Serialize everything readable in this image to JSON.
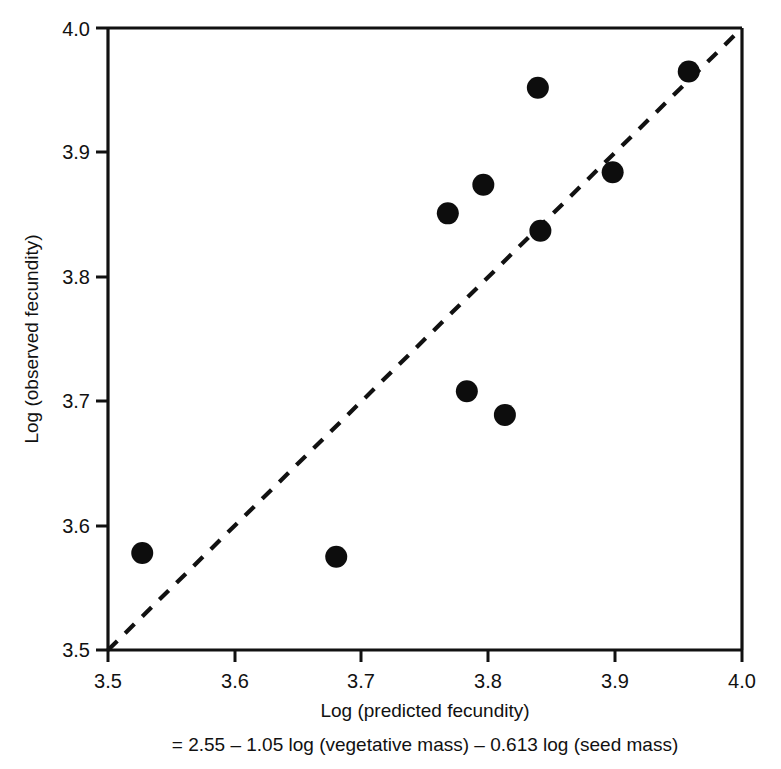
{
  "chart_data": {
    "type": "scatter",
    "title": "",
    "xlabel": "Log (predicted fecundity)",
    "xlabel_line2": "= 2.55 – 1.05 log (vegetative mass) – 0.613 log (seed mass)",
    "ylabel": "Log (observed fecundity)",
    "xlim": [
      3.5,
      4.0
    ],
    "ylim": [
      3.5,
      4.0
    ],
    "grid": false,
    "legend": "none",
    "xticks": [
      "3.5",
      "3.6",
      "3.7",
      "3.8",
      "3.9",
      "4.0"
    ],
    "yticks": [
      "3.5",
      "3.6",
      "3.7",
      "3.8",
      "3.9",
      "4.0"
    ],
    "xtick_values": [
      3.5,
      3.6,
      3.7,
      3.8,
      3.9,
      4.0
    ],
    "ytick_values": [
      3.5,
      3.6,
      3.7,
      3.8,
      3.9,
      4.0
    ],
    "marker": "filled-circle",
    "marker_color": "#0d0d0d",
    "marker_size_px": 22,
    "points": [
      {
        "x": 3.527,
        "y": 3.578
      },
      {
        "x": 3.68,
        "y": 3.575
      },
      {
        "x": 3.768,
        "y": 3.851
      },
      {
        "x": 3.783,
        "y": 3.708
      },
      {
        "x": 3.796,
        "y": 3.874
      },
      {
        "x": 3.813,
        "y": 3.689
      },
      {
        "x": 3.839,
        "y": 3.952
      },
      {
        "x": 3.841,
        "y": 3.837
      },
      {
        "x": 3.898,
        "y": 3.884
      },
      {
        "x": 3.958,
        "y": 3.965
      }
    ],
    "series": [
      {
        "name": "observed vs predicted",
        "x": [
          3.527,
          3.68,
          3.768,
          3.783,
          3.796,
          3.813,
          3.839,
          3.841,
          3.898,
          3.958
        ],
        "y": [
          3.578,
          3.575,
          3.851,
          3.708,
          3.874,
          3.689,
          3.952,
          3.837,
          3.884,
          3.965
        ]
      }
    ],
    "reference_line": {
      "name": "1:1 line",
      "style": "dashed",
      "color": "#111111",
      "from": [
        3.5,
        3.5
      ],
      "to": [
        4.0,
        4.0
      ],
      "slope": 1,
      "intercept": 0
    }
  }
}
